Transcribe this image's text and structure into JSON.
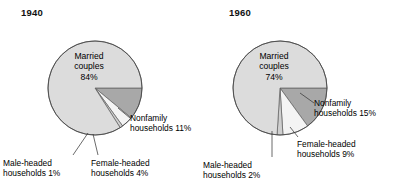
{
  "chart_data": [
    {
      "type": "pie",
      "title": "1940",
      "categories": [
        "Married couples",
        "Nonfamily households",
        "Female-headed households",
        "Male-headed households"
      ],
      "values": [
        84,
        11,
        4,
        1
      ],
      "value_labels": [
        "84%",
        "11%",
        "4%",
        "1%"
      ],
      "units": "percent",
      "legend": "none",
      "colors": [
        "#dcdcdc",
        "#a8a8a8",
        "#f4f4f4",
        "#cfcfcf"
      ],
      "center_label": {
        "line1": "Married",
        "line2": "couples",
        "line3": "84%"
      },
      "callouts": [
        {
          "id": "nonfamily",
          "line1": "Nonfamily",
          "line2": "households 11%"
        },
        {
          "id": "male",
          "line1": "Male-headed",
          "line2": "households 1%"
        },
        {
          "id": "female",
          "line1": "Female-headed",
          "line2": "households 4%"
        }
      ]
    },
    {
      "type": "pie",
      "title": "1960",
      "categories": [
        "Married couples",
        "Nonfamily households",
        "Female-headed households",
        "Male-headed households"
      ],
      "values": [
        74,
        15,
        9,
        2
      ],
      "value_labels": [
        "74%",
        "15%",
        "9%",
        "2%"
      ],
      "units": "percent",
      "legend": "none",
      "colors": [
        "#dcdcdc",
        "#a8a8a8",
        "#f4f4f4",
        "#cfcfcf"
      ],
      "center_label": {
        "line1": "Married",
        "line2": "couples",
        "line3": "74%"
      },
      "callouts": [
        {
          "id": "nonfamily",
          "line1": "Nonfamily",
          "line2": "households 15%"
        },
        {
          "id": "female",
          "line1": "Female-headed",
          "line2": "households 9%"
        },
        {
          "id": "male",
          "line1": "Male-headed",
          "line2": "households 2%"
        }
      ]
    }
  ],
  "figure": {
    "background": "#ffffff",
    "pies": [
      {
        "year": "1940",
        "cx": 95,
        "cy": 88,
        "r": 47
      },
      {
        "year": "1960",
        "cx": 280,
        "cy": 88,
        "r": 47
      }
    ]
  }
}
